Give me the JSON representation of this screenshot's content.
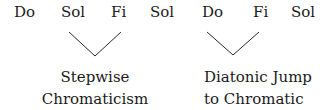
{
  "groups": [
    {
      "notes": [
        "Do",
        "Sol",
        "Fi",
        "Sol"
      ],
      "label_lines": [
        "Stepwise",
        "Chromaticism"
      ]
    },
    {
      "notes": [
        "Do",
        "Fi",
        "Sol"
      ],
      "label_lines": [
        "Diatonic Jump",
        "to Chromatic"
      ]
    }
  ],
  "colors": {
    "text": "#1a1a1a",
    "line": "#2a2a2a",
    "background": "#ffffff"
  }
}
